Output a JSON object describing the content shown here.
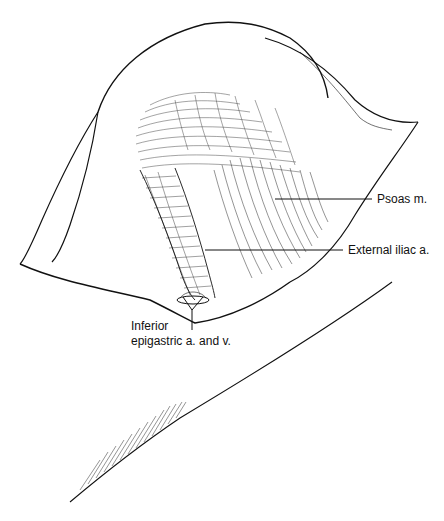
{
  "figure": {
    "type": "anatomical line illustration",
    "line_color": "#111111",
    "background": "#ffffff"
  },
  "labels": {
    "psoas": "Psoas m.",
    "external_iliac": "External iliac a.",
    "inferior_epigastric_line1": "Inferior",
    "inferior_epigastric_line2": "epigastric a. and v."
  }
}
